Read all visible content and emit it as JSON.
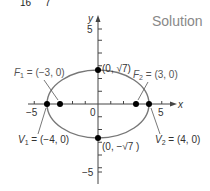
{
  "header": {
    "top_fragment_left": "16",
    "top_fragment_right": "7",
    "solution_label": "Solution"
  },
  "axes": {
    "x_label": "x",
    "y_label": "y",
    "x_ticks": {
      "neg": "−5",
      "pos": "5",
      "origin": "0"
    },
    "y_ticks": {
      "pos": "5",
      "neg": "−5"
    }
  },
  "points": {
    "top_vertex": "(0, √7)",
    "bottom_vertex": "(0, −√7 )",
    "f1_name": "F",
    "f1_sub": "1",
    "f1_value": " = (−3, 0)",
    "f2_name": "F",
    "f2_sub": "2",
    "f2_value": " = (3, 0)",
    "v1_name": "V",
    "v1_sub": "1",
    "v1_value": " = (−4, 0)",
    "v2_name": "V",
    "v2_sub": "2",
    "v2_value": " = (4, 0)"
  },
  "colors": {
    "curve": "#777777",
    "axis": "#444444",
    "dot": "#000000"
  }
}
